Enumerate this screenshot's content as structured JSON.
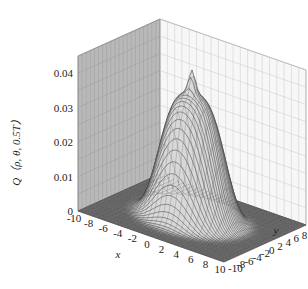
{
  "chart_data": {
    "type": "surface3d",
    "title": "",
    "xlabel": "x",
    "ylabel": "y",
    "zlabel": "Q（ρ, θ, 0.5T）",
    "x_range": [
      -10,
      10
    ],
    "y_range": [
      -10,
      10
    ],
    "z_range": [
      0,
      0.045
    ],
    "x_ticks": [
      "-10",
      "-8",
      "-6",
      "-4",
      "-2",
      "0",
      "2",
      "4",
      "6",
      "8",
      "10"
    ],
    "y_ticks": [
      "-10",
      "-8",
      "-6",
      "-4",
      "-2",
      "0",
      "2",
      "4",
      "6",
      "8",
      "10"
    ],
    "z_ticks": [
      "0",
      "0.01",
      "0.02",
      "0.03",
      "0.04"
    ],
    "grid": true,
    "surface": {
      "description": "Gaussian-like hump centered at origin with sharp peak at center",
      "peak_value": 0.043,
      "shoulder_value": 0.036,
      "center": [
        0,
        0
      ],
      "sigma": 3.2
    }
  },
  "labels": {
    "z_axis": "Q（ρ, θ, 0.5T）",
    "x_axis": "x",
    "y_axis": "y"
  }
}
